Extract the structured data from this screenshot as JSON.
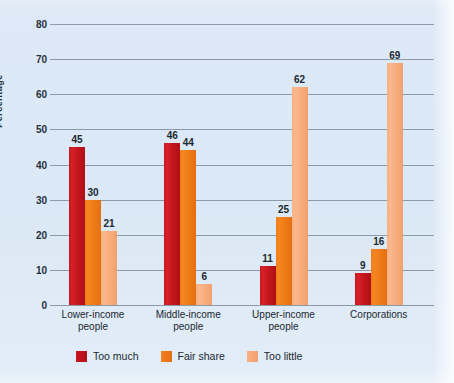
{
  "chart_data": {
    "type": "bar",
    "title": "",
    "xlabel": "",
    "ylabel": "Percentage",
    "ylim": [
      0,
      80
    ],
    "yticks": [
      0,
      10,
      20,
      30,
      40,
      50,
      60,
      70,
      80
    ],
    "ytick_labels": [
      "0",
      "10",
      "20",
      "30",
      "40",
      "50",
      "60",
      "70",
      "80"
    ],
    "grid": true,
    "legend_position": "bottom-left",
    "categories": [
      "Lower-income people",
      "Middle-income people",
      "Upper-income people",
      "Corporations"
    ],
    "category_lines": [
      [
        "Lower-income",
        "people"
      ],
      [
        "Middle-income",
        "people"
      ],
      [
        "Upper-income",
        "people"
      ],
      [
        "Corporations",
        ""
      ]
    ],
    "series": [
      {
        "name": "Too much",
        "color": "#cc2028",
        "values": [
          45,
          46,
          11,
          9
        ]
      },
      {
        "name": "Fair share",
        "color": "#f2801e",
        "values": [
          30,
          44,
          25,
          16
        ]
      },
      {
        "name": "Too little",
        "color": "#f9ad7e",
        "values": [
          21,
          6,
          62,
          69
        ]
      }
    ]
  },
  "colors": {
    "background": "#dce9f5",
    "gridline": "#8d99a6",
    "text": "#20282f",
    "too_much": "#cc2028",
    "fair_share": "#f2801e",
    "too_little": "#f9ad7e"
  }
}
